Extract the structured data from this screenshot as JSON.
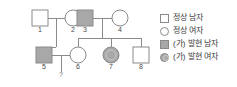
{
  "pedigree": {
    "individuals": [
      {
        "id": "1",
        "label": "1",
        "sex": "male",
        "affected": false,
        "generation": 1,
        "x": 40,
        "y": 18
      },
      {
        "id": "2",
        "label": "2",
        "sex": "female",
        "affected": false,
        "generation": 1,
        "x": 73,
        "y": 18
      },
      {
        "id": "3",
        "label": "3",
        "sex": "male",
        "affected": true,
        "generation": 1,
        "x": 85,
        "y": 18
      },
      {
        "id": "4",
        "label": "4",
        "sex": "female",
        "affected": false,
        "generation": 1,
        "x": 120,
        "y": 18
      },
      {
        "id": "5",
        "label": "5",
        "sex": "male",
        "affected": true,
        "generation": 2,
        "x": 44,
        "y": 55
      },
      {
        "id": "6",
        "label": "6",
        "sex": "female",
        "affected": false,
        "generation": 2,
        "x": 78,
        "y": 55
      },
      {
        "id": "7",
        "label": "7",
        "sex": "female",
        "affected": true,
        "generation": 2,
        "x": 111,
        "y": 55
      },
      {
        "id": "8",
        "label": "8",
        "sex": "male",
        "affected": false,
        "generation": 2,
        "x": 141,
        "y": 55
      }
    ],
    "matings": [
      {
        "partners": [
          "1",
          "2"
        ],
        "children": [
          "5"
        ]
      },
      {
        "partners": [
          "3",
          "4"
        ],
        "children": [
          "6",
          "7",
          "8"
        ]
      },
      {
        "partners": [
          "5",
          "6"
        ],
        "children": [
          "?"
        ]
      }
    ],
    "unknown_child_marker": "?"
  },
  "legend": {
    "items": [
      {
        "symbol": "square-open",
        "label": "정상 남자"
      },
      {
        "symbol": "circle-open",
        "label": "정상 여자"
      },
      {
        "symbol": "square-filled",
        "label": "(가) 발현 남자"
      },
      {
        "symbol": "circle-filled",
        "label": "(가) 발현 여자"
      }
    ]
  },
  "colors": {
    "affected_fill": "#a8a8a8",
    "normal_fill": "#ffffff",
    "stroke": "#8a8a8a",
    "text": "#3c3c3c"
  }
}
